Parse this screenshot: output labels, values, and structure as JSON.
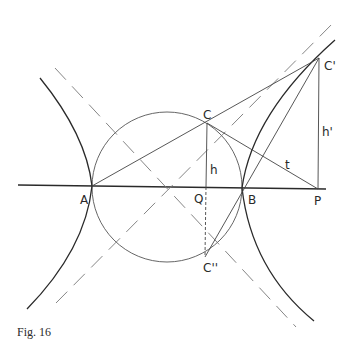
{
  "figure": {
    "caption": "Fig. 16",
    "colors": {
      "line": "#2a2a2a",
      "thin": "#555555",
      "dashed": "#777777",
      "background": "#ffffff"
    }
  },
  "labels": {
    "A": "A",
    "Q": "Q",
    "B": "B",
    "P": "P",
    "C": "C",
    "C_prime": "C'",
    "C_double_prime": "C''",
    "h": "h",
    "h_prime": "h'",
    "t": "t"
  },
  "points": {
    "A": [
      92,
      186
    ],
    "Q": [
      167,
      187
    ],
    "B": [
      242,
      188
    ],
    "P": [
      318,
      189
    ],
    "C": [
      207,
      123
    ],
    "C_prime": [
      319,
      58
    ],
    "C_double_prime": [
      205,
      257
    ]
  },
  "circle": {
    "center": [
      167,
      187
    ],
    "radius": 75
  }
}
